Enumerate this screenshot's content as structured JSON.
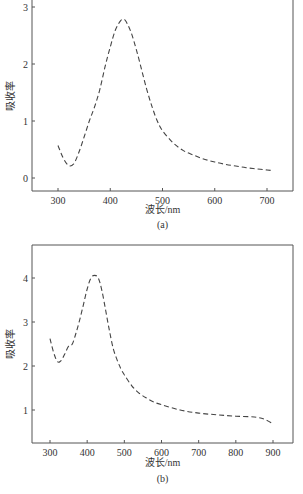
{
  "chart_data": [
    {
      "type": "line",
      "title": "",
      "caption": "(a)",
      "xlabel": "波长/nm",
      "ylabel": "吸收率",
      "xlim": [
        250,
        750
      ],
      "ylim": [
        -0.25,
        3.05
      ],
      "xticks": [
        300,
        400,
        500,
        600,
        700
      ],
      "yticks": [
        0,
        1,
        2,
        3
      ],
      "grid": false,
      "line_style": "dashed",
      "series": [
        {
          "name": "absorbance",
          "x": [
            300,
            310,
            320,
            330,
            340,
            350,
            360,
            370,
            380,
            390,
            400,
            410,
            420,
            425,
            430,
            440,
            450,
            460,
            470,
            480,
            490,
            500,
            520,
            540,
            560,
            580,
            600,
            620,
            640,
            660,
            680,
            700,
            710
          ],
          "y": [
            0.57,
            0.35,
            0.22,
            0.25,
            0.45,
            0.72,
            1.0,
            1.25,
            1.55,
            1.95,
            2.3,
            2.6,
            2.76,
            2.78,
            2.75,
            2.55,
            2.25,
            1.9,
            1.55,
            1.25,
            1.0,
            0.83,
            0.62,
            0.48,
            0.4,
            0.33,
            0.28,
            0.24,
            0.21,
            0.18,
            0.16,
            0.14,
            0.13
          ]
        }
      ]
    },
    {
      "type": "line",
      "title": "",
      "caption": "(b)",
      "xlabel": "波长/nm",
      "ylabel": "吸收率",
      "xlim": [
        250,
        955
      ],
      "ylim": [
        0.25,
        4.75
      ],
      "xticks": [
        300,
        400,
        500,
        600,
        700,
        800,
        900
      ],
      "yticks": [
        1,
        2,
        3,
        4
      ],
      "grid": false,
      "line_style": "dashed",
      "series": [
        {
          "name": "absorbance",
          "x": [
            300,
            310,
            320,
            330,
            340,
            350,
            360,
            370,
            380,
            390,
            400,
            410,
            420,
            430,
            440,
            450,
            460,
            470,
            480,
            490,
            500,
            520,
            540,
            560,
            580,
            600,
            650,
            700,
            750,
            800,
            850,
            880,
            900
          ],
          "y": [
            2.62,
            2.3,
            2.1,
            2.12,
            2.28,
            2.45,
            2.5,
            2.75,
            3.05,
            3.4,
            3.75,
            4.0,
            4.06,
            4.0,
            3.7,
            3.25,
            2.8,
            2.4,
            2.15,
            1.95,
            1.8,
            1.55,
            1.38,
            1.27,
            1.18,
            1.12,
            1.0,
            0.93,
            0.89,
            0.86,
            0.84,
            0.78,
            0.68
          ]
        }
      ]
    }
  ]
}
